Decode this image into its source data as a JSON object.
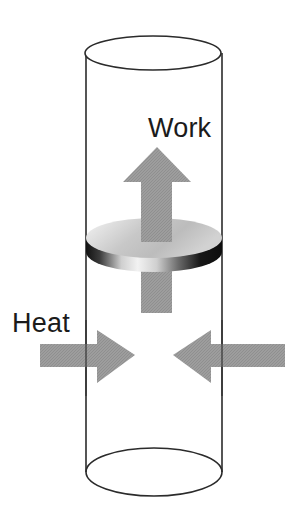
{
  "figure": {
    "background_color": "#ffffff",
    "labels": {
      "work": "Work",
      "heat": "Heat"
    },
    "colors": {
      "text": "#1b1b1b",
      "outline": "#2b2b2b",
      "arrow_gray": "#9a9a9a",
      "arrow_gray_light": "#b0b0b0",
      "disk_top_light": "#f2f2f2",
      "disk_top_mid": "#bdbdbd",
      "disk_edge_dark": "#1a1a1a",
      "disk_edge_light": "#ededed",
      "cylinder_fill": "#ffffff"
    },
    "parts": {
      "cylinder": "cylinder-vessel",
      "piston": "piston-disk",
      "work_arrow": "work-arrow-up",
      "heat_arrow_left": "heat-arrow-right-pointing",
      "heat_arrow_right": "heat-arrow-left-pointing"
    }
  }
}
